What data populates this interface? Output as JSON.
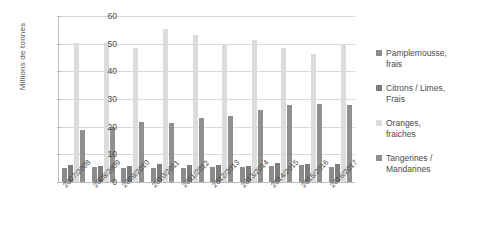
{
  "chart_data": {
    "type": "bar",
    "title": "",
    "xlabel": "",
    "ylabel": "Millions de tonnes",
    "ylim": [
      0,
      60
    ],
    "ytick_step": 10,
    "yticks": [
      60,
      50,
      40,
      30,
      20,
      10,
      0
    ],
    "grid": true,
    "legend_position": "right",
    "categories": [
      "2007/2008",
      "2008/2009",
      "2009/2010",
      "2010/2011",
      "2011/2012",
      "2012/2013",
      "2013/2014",
      "2014/2015",
      "2015/2016",
      "2016/2017"
    ],
    "series": [
      {
        "name": "Pamplemousse, frais",
        "color": "#8c8c8c",
        "values": [
          5.2,
          5.3,
          5.2,
          4.9,
          5.1,
          5.4,
          5.5,
          5.9,
          6.0,
          5.5
        ]
      },
      {
        "name": "Citrons / Limes, Frais",
        "color": "#7d7d7d",
        "values": [
          6.1,
          5.7,
          5.7,
          6.6,
          6.2,
          6.1,
          5.8,
          6.8,
          6.4,
          6.6
        ]
      },
      {
        "name": "Oranges, fraiches",
        "color": "#dcdcdc",
        "values": [
          50.3,
          50.4,
          48.6,
          55.3,
          53.1,
          49.6,
          51.4,
          48.4,
          46.2,
          49.5
        ]
      },
      {
        "name": "Tangerines / Mandarines",
        "color": "#909090",
        "values": [
          18.9,
          20.0,
          21.7,
          21.5,
          23.3,
          24.0,
          26.0,
          27.8,
          28.2,
          27.9
        ]
      }
    ]
  },
  "axis": {
    "y_title": "Millions de tonnes"
  },
  "legend": {
    "items": [
      {
        "label_line1": "Pamplemousse,",
        "label_line2": "frais"
      },
      {
        "label_line1": "Citrons / Limes,",
        "label_line2": "Frais"
      },
      {
        "label_line1": "Oranges,",
        "label_line2": "fraiches"
      },
      {
        "label_line1": "Tangerines /",
        "label_line2": "Mandarines"
      }
    ]
  }
}
